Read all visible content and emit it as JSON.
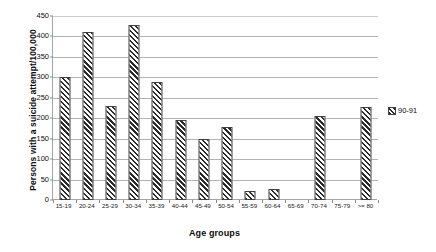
{
  "chart_data": {
    "type": "bar",
    "title": "",
    "xlabel": "Age groups",
    "ylabel": "Persons with a suicide attempt/100,000",
    "ylim": [
      0,
      450
    ],
    "ytick_step": 50,
    "yticks": [
      0,
      50,
      100,
      150,
      200,
      250,
      300,
      350,
      400,
      450
    ],
    "grid": true,
    "legend_position": "right",
    "categories": [
      "15-19",
      "20-24",
      "25-29",
      "30-34",
      "35-39",
      "40-44",
      "45-49",
      "50-54",
      "55-59",
      "60-64",
      "65-69",
      "70-74",
      "75-79",
      ">= 80"
    ],
    "series": [
      {
        "name": "90-91",
        "values": [
          300,
          410,
          230,
          428,
          288,
          195,
          150,
          178,
          22,
          28,
          0,
          205,
          0,
          228
        ]
      }
    ],
    "bar_color": "#ffffff",
    "bar_edge_color": "#404040",
    "hatch": "diagonal-forward",
    "gridline_color": "#b3b3b3",
    "axis_color": "#a6a6a6",
    "background_color": "#ffffff"
  }
}
